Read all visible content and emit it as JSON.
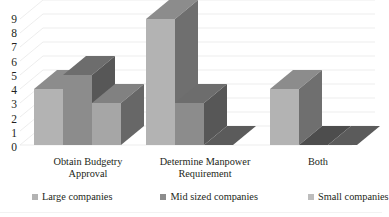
{
  "chart_data": {
    "type": "bar",
    "title": "",
    "subtitle": "",
    "xlabel": "",
    "ylabel": "",
    "ylim": [
      0,
      9
    ],
    "yticks": [
      0,
      1,
      2,
      3,
      4,
      5,
      6,
      7,
      8,
      9
    ],
    "grid": true,
    "three_d": true,
    "legend_position": "bottom",
    "categories": [
      "Obtain Budgetry Approval",
      "Determine Manpower Requirement",
      "Both"
    ],
    "category_lines": [
      [
        "Obtain Budgetry",
        "Approval"
      ],
      [
        "Determine Manpower",
        "Requirement"
      ],
      [
        "Both",
        ""
      ]
    ],
    "series": [
      {
        "name": "Large companies",
        "values": [
          4,
          9,
          4
        ],
        "color": "#b3b3b3"
      },
      {
        "name": "Mid sized companies",
        "values": [
          5,
          3,
          0
        ],
        "color": "#8c8c8c"
      },
      {
        "name": "Small companies",
        "values": [
          3,
          0,
          0
        ],
        "color": "#a6a6a6"
      }
    ]
  },
  "axis": {
    "tick_labels": [
      "9",
      "8",
      "7",
      "6",
      "5",
      "4",
      "3",
      "2",
      "1",
      "0"
    ]
  },
  "legend": {
    "items": [
      {
        "label": "Large companies",
        "swatch": "#b3b3b3"
      },
      {
        "label": "Mid sized companies",
        "swatch": "#8c8c8c"
      },
      {
        "label": "Small companies",
        "swatch": "#bdbdbd"
      }
    ]
  },
  "colors": {
    "gridline": "#e8e8e8",
    "background": "#ffffff",
    "text": "#231f20",
    "bar_top_shade": "#6e6e6e",
    "bar_side_shade": "#5f5f5f"
  }
}
